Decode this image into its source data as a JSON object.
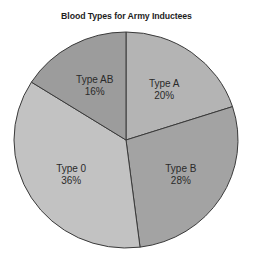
{
  "chart_data": {
    "type": "pie",
    "title": "Blood Types for Army Inductees",
    "start_angle_deg": 0,
    "direction": "clockwise",
    "slices": [
      {
        "label": "Type A",
        "value": 20,
        "display": "20%",
        "color": "#b4b4b4"
      },
      {
        "label": "Type B",
        "value": 28,
        "display": "28%",
        "color": "#a3a3a3"
      },
      {
        "label": "Type 0",
        "value": 36,
        "display": "36%",
        "color": "#c2c2c2"
      },
      {
        "label": "Type AB",
        "value": 16,
        "display": "16%",
        "color": "#9c9c9c"
      }
    ],
    "legend": "none",
    "grid": false
  },
  "style": {
    "edge_color": "#3a3a3a",
    "center": [
      126,
      140
    ],
    "rx": 112,
    "ry": 108
  }
}
